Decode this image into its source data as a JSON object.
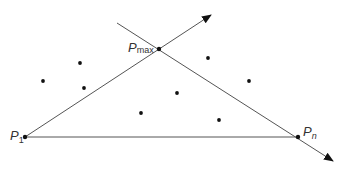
{
  "diagram": {
    "title": "",
    "line_color": "#555555",
    "point_color": "#111111",
    "labels": {
      "p1": {
        "base": "P",
        "sub": "1"
      },
      "pn": {
        "base": "P",
        "sub": "n"
      },
      "pmax": {
        "base": "P",
        "sub": "max"
      }
    },
    "key_points": {
      "p1": [
        25,
        137
      ],
      "pn": [
        298,
        137
      ],
      "pmax": [
        159,
        49
      ]
    },
    "arrows": [
      {
        "name": "p1-to-pmax-ray",
        "from": [
          25,
          137
        ],
        "to": [
          211,
          15
        ]
      },
      {
        "name": "pmax-through-pn-ray",
        "from": [
          117,
          23
        ],
        "to": [
          333,
          161
        ]
      }
    ],
    "segments": [
      {
        "name": "p1-pn-base",
        "from": [
          25,
          137
        ],
        "to": [
          298,
          137
        ]
      }
    ],
    "scatter_points": [
      [
        43,
        81
      ],
      [
        80,
        63
      ],
      [
        84,
        88
      ],
      [
        141,
        113
      ],
      [
        177,
        93
      ],
      [
        208,
        58
      ],
      [
        219,
        120
      ],
      [
        249,
        81
      ]
    ]
  }
}
